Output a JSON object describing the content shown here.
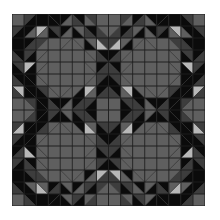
{
  "quilt": {
    "rows": 16,
    "cols": 16,
    "palette": {
      "K": "#0b0b0b",
      "D": "#3d3d3d",
      "M": "#5f5f5f",
      "L": "#b8b8b8",
      "grid": "#1e1e1e"
    },
    "quadrant_tl": [
      [
        "M",
        "D/K",
        "K",
        "K\\K",
        "K/M",
        "K\\D",
        "D\\M",
        "M"
      ],
      [
        "D/K",
        "K/M",
        "L/M",
        "D\\K",
        "K/M",
        "M\\K",
        "K\\D",
        "M\\D"
      ],
      [
        "K",
        "K/D",
        "D/M",
        "M",
        "M/M",
        "M\\M",
        "M\\K",
        "D\\L"
      ],
      [
        "K\\D",
        "D/K",
        "M/M",
        "M",
        "M",
        "M",
        "M\\M",
        "K\\D"
      ],
      [
        "D\\K",
        "L/K",
        "M/M",
        "M",
        "M",
        "M",
        "M\\M",
        "K/D"
      ],
      [
        "K\\D",
        "K\\K",
        "M\\M",
        "M",
        "M",
        "M",
        "M/M",
        "D/K"
      ],
      [
        "L\\D",
        "K\\K",
        "D\\K",
        "M\\M",
        "M/M",
        "M/K",
        "L/M",
        "K/D"
      ],
      [
        "M",
        "D\\M",
        "K\\K",
        "K\\D",
        "K/M",
        "K/D",
        "D/K",
        "M"
      ]
    ]
  }
}
